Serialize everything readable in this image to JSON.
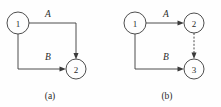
{
  "figure": {
    "background_color": "#fefefe",
    "stroke_color": "#3a3a3a",
    "text_color": "#2b2b2b",
    "panels": [
      {
        "id": "panel-a",
        "caption": "(a)",
        "nodes": [
          {
            "id": "a-node-1",
            "label": "1",
            "cx": 18,
            "cy": 23,
            "r": 11
          },
          {
            "id": "a-node-2",
            "label": "2",
            "cx": 76,
            "cy": 69,
            "r": 10
          }
        ],
        "edges": [
          {
            "id": "a-edge-A",
            "label": "A",
            "from": "1",
            "to": "2",
            "style": "solid",
            "label_x": 48,
            "label_y": 17
          },
          {
            "id": "a-edge-B",
            "label": "B",
            "from": "1",
            "to": "2",
            "style": "solid",
            "label_x": 48,
            "label_y": 60
          }
        ]
      },
      {
        "id": "panel-b",
        "caption": "(b)",
        "nodes": [
          {
            "id": "b-node-1",
            "label": "1",
            "cx": 135,
            "cy": 23,
            "r": 11
          },
          {
            "id": "b-node-2",
            "label": "2",
            "cx": 194,
            "cy": 23,
            "r": 10
          },
          {
            "id": "b-node-3",
            "label": "3",
            "cx": 194,
            "cy": 69,
            "r": 10
          }
        ],
        "edges": [
          {
            "id": "b-edge-A",
            "label": "A",
            "from": "1",
            "to": "2",
            "style": "solid",
            "label_x": 166,
            "label_y": 17
          },
          {
            "id": "b-edge-B",
            "label": "B",
            "from": "1",
            "to": "3",
            "style": "solid",
            "label_x": 166,
            "label_y": 60
          },
          {
            "id": "b-edge-dashed",
            "label": "",
            "from": "2",
            "to": "3",
            "style": "dashed",
            "label_x": 0,
            "label_y": 0
          }
        ]
      }
    ]
  }
}
